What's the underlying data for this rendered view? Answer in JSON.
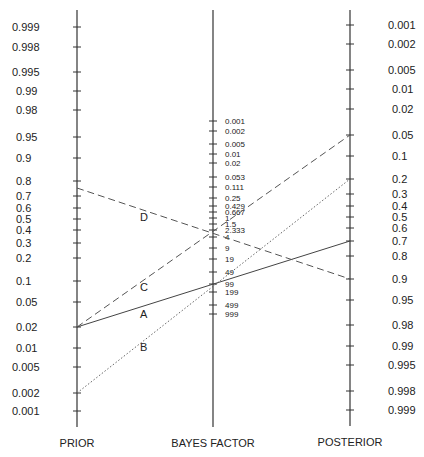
{
  "chart_data": {
    "type": "line",
    "title": "",
    "subtype": "Bayes nomogram (Fagan nomogram)",
    "axes": [
      {
        "name": "PRIOR",
        "label": "PRIOR",
        "position": "left",
        "ticks": [
          "0.999",
          "0.998",
          "0.995",
          "0.99",
          "0.98",
          "0.95",
          "0.9",
          "0.8",
          "0.7",
          "0.6",
          "0.5",
          "0.4",
          "0.3",
          "0.2",
          "0.1",
          "0.05",
          "0.02",
          "0.01",
          "0.005",
          "0.002",
          "0.001"
        ]
      },
      {
        "name": "BAYES FACTOR",
        "label": "BAYES FACTOR",
        "position": "center",
        "ticks": [
          "0.001",
          "0.002",
          "0.005",
          "0.01",
          "0.02",
          "0.053",
          "0.111",
          "0.25",
          "0.429",
          "0.667",
          "1",
          "1.5",
          "2.333",
          "4",
          "9",
          "19",
          "49",
          "99",
          "199",
          "499",
          "999"
        ]
      },
      {
        "name": "POSTERIOR",
        "label": "POSTERIOR",
        "position": "right",
        "ticks": [
          "0.001",
          "0.002",
          "0.005",
          "0.01",
          "0.02",
          "0.05",
          "0.1",
          "0.2",
          "0.3",
          "0.4",
          "0.5",
          "0.6",
          "0.7",
          "0.8",
          "0.9",
          "0.95",
          "0.98",
          "0.99",
          "0.995",
          "0.998",
          "0.999"
        ]
      }
    ],
    "series": [
      {
        "name": "A",
        "style": "solid",
        "prior": 0.02,
        "bayes_factor": 99,
        "posterior": 0.7
      },
      {
        "name": "B",
        "style": "dotted",
        "prior": 0.002,
        "bayes_factor": 99,
        "posterior": 0.2
      },
      {
        "name": "C",
        "style": "dashed",
        "prior": 0.02,
        "bayes_factor": 2.333,
        "posterior": 0.05
      },
      {
        "name": "D",
        "style": "dashed",
        "prior": 0.75,
        "bayes_factor": 2.333,
        "posterior": 0.9
      }
    ],
    "grid": false,
    "legend": "inline letter labels on lines"
  },
  "labels": {
    "prior": "PRIOR",
    "bayes_factor": "BAYES FACTOR",
    "posterior": "POSTERIOR",
    "line_a": "A",
    "line_b": "B",
    "line_c": "C",
    "line_d": "D"
  }
}
